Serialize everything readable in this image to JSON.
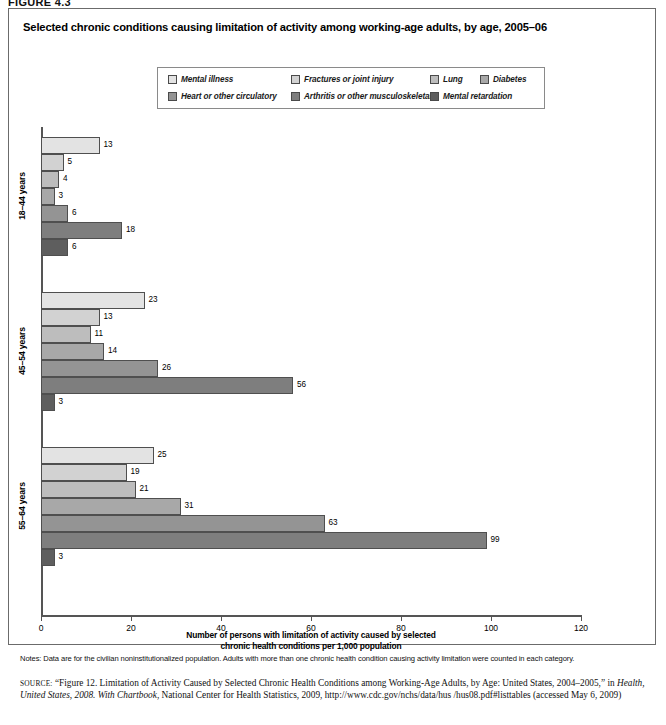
{
  "figure_label": "FIGURE 4.3",
  "chart_title": "Selected chronic conditions causing limitation of activity among working-age adults, by age, 2005–06",
  "legend": {
    "items": [
      {
        "label": "Mental illness",
        "color": "#e3e3e3",
        "row": 1,
        "x": 10
      },
      {
        "label": "Fractures or joint injury",
        "color": "#d2d2d2",
        "row": 1,
        "x": 133
      },
      {
        "label": "Lung",
        "color": "#bdbdbd",
        "row": 1,
        "x": 272
      },
      {
        "label": "Diabetes",
        "color": "#a8a8a8",
        "row": 1,
        "x": 322
      },
      {
        "label": "Heart or other circulatory",
        "color": "#949494",
        "row": 2,
        "x": 10
      },
      {
        "label": "Arthritis or other musculoskeletal",
        "color": "#7e7e7e",
        "row": 2,
        "x": 133
      },
      {
        "label": "Mental retardation",
        "color": "#5e5e5e",
        "row": 2,
        "x": 272
      }
    ]
  },
  "chart_data": {
    "type": "bar",
    "orientation": "horizontal",
    "title": "Selected chronic conditions causing limitation of activity among working-age adults, by age, 2005–06",
    "xlabel": "Number of persons with limitation of activity caused by selected chronic health conditions per 1,000 population",
    "ylabel": "",
    "xlim": [
      0,
      120
    ],
    "xticks": [
      0,
      20,
      40,
      60,
      80,
      100,
      120
    ],
    "grid": false,
    "legend_position": "top-center",
    "categories": [
      "18–44 years",
      "45–54 years",
      "55–64 years"
    ],
    "series": [
      {
        "name": "Mental illness",
        "color": "#e3e3e3",
        "values": [
          13,
          23,
          25
        ]
      },
      {
        "name": "Fractures or joint injury",
        "color": "#d2d2d2",
        "values": [
          5,
          13,
          19
        ]
      },
      {
        "name": "Lung",
        "color": "#bdbdbd",
        "values": [
          4,
          11,
          21
        ]
      },
      {
        "name": "Diabetes",
        "color": "#a8a8a8",
        "values": [
          3,
          14,
          31
        ]
      },
      {
        "name": "Heart or other circulatory",
        "color": "#949494",
        "values": [
          6,
          26,
          63
        ]
      },
      {
        "name": "Arthritis or other musculoskeletal",
        "color": "#7e7e7e",
        "values": [
          18,
          56,
          99
        ]
      },
      {
        "name": "Mental retardation",
        "color": "#5e5e5e",
        "values": [
          6,
          3,
          3
        ]
      }
    ]
  },
  "axis": {
    "x_title_line1": "Number of persons with limitation of activity caused by selected",
    "x_title_line2": "chronic health conditions per 1,000 population",
    "tick_labels": [
      "0",
      "20",
      "40",
      "60",
      "80",
      "100",
      "120"
    ]
  },
  "group_labels": [
    "18–44 years",
    "45–54 years",
    "55–64 years"
  ],
  "notes": "Notes: Data are for the civilian noninstitutionalized population. Adults with more than one chronic health condition causing activity limitation were counted in each category.",
  "source": {
    "prefix": "SOURCE:",
    "part1": " “Figure 12. Limitation of Activity Caused by Selected Chronic Health Conditions among Working-Age Adults, by Age: United States, 2004–2005,” in ",
    "italic1": "Health, United States, 2008. With Chartbook",
    "part2": ", National Center for Health Statistics, 2009, http://www.cdc.gov/nchs/data/hus /hus08.pdf#listtables (accessed May 6, 2009)"
  }
}
